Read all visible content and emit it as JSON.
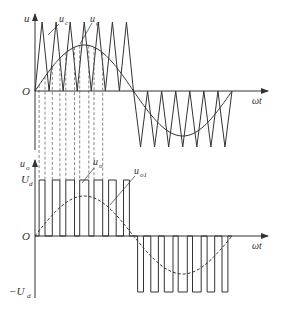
{
  "upper_plot": {
    "y_axis_label": "u",
    "x_axis_label": "ωt",
    "origin_label": "O",
    "carrier_label": "u",
    "carrier_sub": "c",
    "signal_label": "u",
    "signal_sub": "g"
  },
  "lower_plot": {
    "y_axis_label": "u",
    "y_axis_sub": "o",
    "x_axis_label": "ωt",
    "origin_label": "O",
    "pos_level_label": "U",
    "pos_level_sub": "d",
    "neg_level_label": "−U",
    "neg_level_sub": "d",
    "output_label": "u",
    "output_sub": "o",
    "fundamental_label": "u",
    "fundamental_sub": "o1"
  },
  "colors": {
    "line": "#333333",
    "background": "#ffffff"
  },
  "chart_data": {
    "type": "line",
    "panels": [
      {
        "name": "carrier-vs-modulating",
        "series": [
          {
            "name": "u_c (triangular carrier)",
            "style": "solid",
            "periods_per_half_cycle": 7,
            "amplitude": 1.0
          },
          {
            "name": "u_g (sinusoidal modulating)",
            "style": "solid",
            "amplitude": 0.67,
            "cycles": 1
          }
        ],
        "xlabel": "ωt",
        "ylabel": "u"
      },
      {
        "name": "output-voltage",
        "series": [
          {
            "name": "u_o (PWM pulses)",
            "style": "solid",
            "levels": [
              "U_d",
              "0",
              "-U_d"
            ],
            "pulses_per_half_cycle": 7
          },
          {
            "name": "u_o1 (fundamental)",
            "style": "dashed",
            "amplitude": 0.67
          }
        ],
        "xlabel": "ωt",
        "ylabel": "u_o",
        "yticks": [
          "U_d",
          "O",
          "-U_d"
        ]
      }
    ]
  }
}
